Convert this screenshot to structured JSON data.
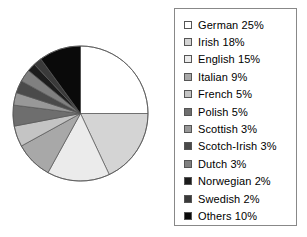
{
  "chart_data": {
    "type": "pie",
    "title": "",
    "subtitle": "",
    "xlabel": "",
    "ylabel": "",
    "grid": false,
    "legend_position": "right",
    "start_angle_clock": "12 o'clock",
    "direction": "clockwise",
    "units": "percent",
    "total": 100,
    "categories": [
      "German",
      "Irish",
      "English",
      "Italian",
      "French",
      "Polish",
      "Scottish",
      "Scotch-Irish",
      "Dutch",
      "Norwegian",
      "Swedish",
      "Others"
    ],
    "values": [
      25,
      18,
      15,
      9,
      5,
      5,
      3,
      3,
      3,
      2,
      2,
      10
    ],
    "colors": [
      "#ffffff",
      "#d4d4d4",
      "#ebebeb",
      "#a8a8a8",
      "#c4c4c4",
      "#6e6e6e",
      "#989898",
      "#4a4a4a",
      "#808080",
      "#1c1c1c",
      "#3a3a3a",
      "#0a0a0a"
    ],
    "slice_border_color": "#555555",
    "slice_border_width": 0.7
  },
  "legend": {
    "border_color": "#888888",
    "items": [
      {
        "label": "German 25%",
        "name": "German",
        "value": 25,
        "color": "#ffffff"
      },
      {
        "label": "Irish 18%",
        "name": "Irish",
        "value": 18,
        "color": "#d4d4d4"
      },
      {
        "label": "English 15%",
        "name": "English",
        "value": 15,
        "color": "#ebebeb"
      },
      {
        "label": "Italian 9%",
        "name": "Italian",
        "value": 9,
        "color": "#a8a8a8"
      },
      {
        "label": "French 5%",
        "name": "French",
        "value": 5,
        "color": "#c4c4c4"
      },
      {
        "label": "Polish 5%",
        "name": "Polish",
        "value": 5,
        "color": "#6e6e6e"
      },
      {
        "label": "Scottish 3%",
        "name": "Scottish",
        "value": 3,
        "color": "#989898"
      },
      {
        "label": "Scotch-Irish 3%",
        "name": "Scotch-Irish",
        "value": 3,
        "color": "#4a4a4a"
      },
      {
        "label": "Dutch 3%",
        "name": "Dutch",
        "value": 3,
        "color": "#808080"
      },
      {
        "label": "Norwegian 2%",
        "name": "Norwegian",
        "value": 2,
        "color": "#1c1c1c"
      },
      {
        "label": "Swedish 2%",
        "name": "Swedish",
        "value": 2,
        "color": "#3a3a3a"
      },
      {
        "label": "Others 10%",
        "name": "Others",
        "value": 10,
        "color": "#0a0a0a"
      }
    ]
  },
  "pie_geometry": {
    "center_x": 69.5,
    "center_y": 69.5,
    "radius": 67.5,
    "outline_color": "#555555"
  }
}
